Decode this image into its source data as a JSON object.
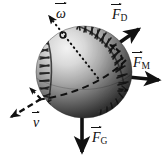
{
  "figure": {
    "background_color": "#ffffff",
    "width": 164,
    "height": 162,
    "ink_color": "#111111"
  },
  "ball": {
    "name": "baseball",
    "center_x": 84,
    "center_y": 72,
    "radius_x": 48,
    "radius_y": 46,
    "highlight_color": "#e8e8e8",
    "midtone_color": "#8a8a8a",
    "shadow_color": "#1c1c1c",
    "seam_color": "#151515"
  },
  "labels": {
    "omega": {
      "symbol": "ω",
      "subscript": "",
      "vector": true,
      "description": "angular-velocity"
    },
    "drag": {
      "symbol": "F",
      "subscript": "D",
      "vector": true,
      "description": "drag-force"
    },
    "magnus": {
      "symbol": "F",
      "subscript": "M",
      "vector": true,
      "description": "magnus-force"
    },
    "gravity": {
      "symbol": "F",
      "subscript": "G",
      "vector": true,
      "description": "gravitational-force"
    },
    "velocity": {
      "symbol": "v",
      "subscript": "",
      "vector": true,
      "description": "velocity"
    }
  },
  "vectors": {
    "omega": {
      "style": "dotted",
      "from_x": 96,
      "from_y": 76,
      "to_x": 47,
      "to_y": 14,
      "label": "ω"
    },
    "drag": {
      "style": "solid",
      "from_x": 108,
      "from_y": 52,
      "to_x": 140,
      "to_y": 28,
      "label": "F_D"
    },
    "magnus": {
      "style": "solid",
      "from_x": 108,
      "from_y": 75,
      "to_x": 160,
      "to_y": 80,
      "label": "F_M"
    },
    "gravity": {
      "style": "solid",
      "from_x": 82,
      "from_y": 110,
      "to_x": 82,
      "to_y": 155,
      "label": "F_G"
    },
    "velocity": {
      "style": "dashed",
      "from_x": 40,
      "from_y": 99,
      "to_x": 9,
      "to_y": 118,
      "label": "v"
    }
  },
  "trajectory": {
    "style": "dashed",
    "description": "flight-path-curve"
  },
  "spin_arc": {
    "style": "dashed",
    "description": "spin-direction-arc"
  }
}
